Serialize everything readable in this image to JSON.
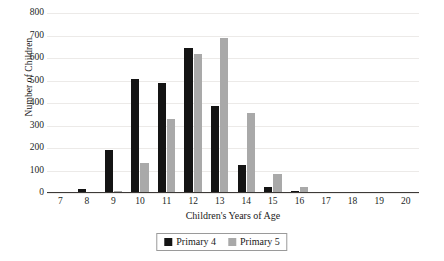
{
  "chart_data": {
    "type": "bar",
    "title": "",
    "xlabel": "Children's Years of Age",
    "ylabel": "Number of Children",
    "categories": [
      "7",
      "8",
      "9",
      "10",
      "11",
      "12",
      "13",
      "14",
      "15",
      "16",
      "17",
      "18",
      "19",
      "20"
    ],
    "series": [
      {
        "name": "Primary 4",
        "color": "#141414",
        "values": [
          0,
          18,
          190,
          505,
          487,
          643,
          385,
          125,
          25,
          8,
          0,
          0,
          0,
          0
        ]
      },
      {
        "name": "Primary 5",
        "color": "#a9a9a9",
        "values": [
          0,
          0,
          8,
          135,
          330,
          620,
          690,
          355,
          85,
          25,
          5,
          0,
          0,
          0
        ]
      }
    ],
    "ylim": [
      0,
      800
    ],
    "yticks": [
      "0",
      "100",
      "200",
      "300",
      "400",
      "500",
      "600",
      "700",
      "800"
    ],
    "ytick_values": [
      0,
      100,
      200,
      300,
      400,
      500,
      600,
      700,
      800
    ],
    "grid": "horizontal",
    "legend_position": "bottom"
  },
  "legend": {
    "entries": [
      {
        "label": "Primary 4",
        "color": "#141414"
      },
      {
        "label": "Primary 5",
        "color": "#a9a9a9"
      }
    ]
  },
  "axes": {
    "x_title": "Children's Years of Age",
    "y_title": "Number of Children"
  },
  "colors": {
    "primary4": "#141414",
    "primary5": "#a9a9a9",
    "gridline": "#eceae8",
    "axis": "#3d3a38",
    "text": "#231f1e",
    "background": "#ffffff"
  }
}
